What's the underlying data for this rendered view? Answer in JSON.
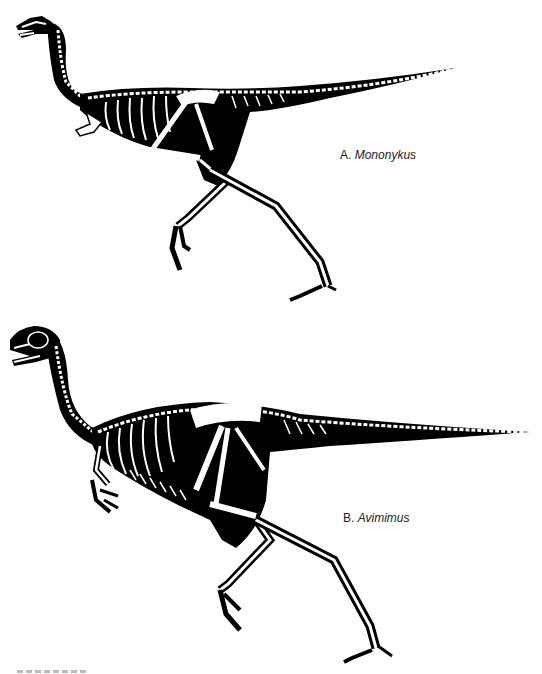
{
  "figure": {
    "panels": [
      {
        "id": "A",
        "letter": "A.",
        "taxon": "Mononykus",
        "depiction": "skeletal reconstruction in running pose, white bones on black body silhouette"
      },
      {
        "id": "B",
        "letter": "B.",
        "taxon": "Avimimus",
        "depiction": "skeletal reconstruction in running pose, white bones on black body silhouette"
      }
    ],
    "colors": {
      "silhouette": "#000000",
      "bone": "#ffffff",
      "background": "#ffffff",
      "label_text": "#222222"
    }
  }
}
